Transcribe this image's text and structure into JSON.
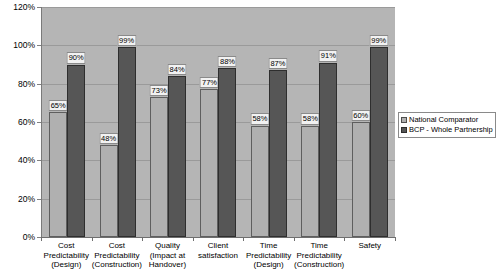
{
  "chart_data": {
    "type": "bar",
    "title": "",
    "xlabel": "",
    "ylabel": "",
    "ylim": [
      0,
      120
    ],
    "y_tick_step": 20,
    "grid": true,
    "legend_position": "right",
    "value_suffix": "%",
    "categories": [
      "Cost Predictability (Design)",
      "Cost Predictability (Construction)",
      "Quality (Impact at Handover)",
      "Client satisfaction",
      "Time Predictability (Design)",
      "Time Predictability (Construction)",
      "Safety"
    ],
    "category_lines": [
      [
        "Cost",
        "Predictability",
        "(Design)"
      ],
      [
        "Cost",
        "Predictability",
        "(Construction)"
      ],
      [
        "Quality",
        "(Impact at",
        "Handover)"
      ],
      [
        "Client",
        "satisfaction",
        ""
      ],
      [
        "Time",
        "Predictability",
        "(Design)"
      ],
      [
        "Time",
        "Predictability",
        "(Construction)"
      ],
      [
        "Safety",
        "",
        ""
      ]
    ],
    "y_tick_labels": [
      "120%",
      "100%",
      "80%",
      "60%",
      "40%",
      "20%",
      "0%"
    ],
    "y_tick_values": [
      120,
      100,
      80,
      60,
      40,
      20,
      0
    ],
    "series": [
      {
        "name": "National Comparator",
        "color": "#b0b0b0",
        "values": [
          65,
          48,
          73,
          77,
          58,
          58,
          60
        ],
        "labels": [
          "65%",
          "48%",
          "73%",
          "77%",
          "58%",
          "58%",
          "60%"
        ]
      },
      {
        "name": "BCP - Whole Partnership",
        "color": "#565656",
        "values": [
          90,
          99,
          84,
          88,
          87,
          91,
          99
        ],
        "labels": [
          "90%",
          "99%",
          "84%",
          "88%",
          "87%",
          "91%",
          "99%"
        ]
      }
    ]
  },
  "legend": {
    "items": [
      {
        "label": "National Comparator",
        "swatch": "legend-swatch-national-comparator"
      },
      {
        "label": "BCP - Whole Partnership",
        "swatch": "legend-swatch-bcp-whole-partnership"
      }
    ]
  }
}
